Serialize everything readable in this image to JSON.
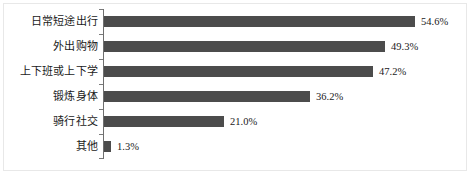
{
  "chart_data": {
    "type": "bar",
    "orientation": "horizontal",
    "title": "",
    "subtitle": "",
    "xlabel": "",
    "ylabel": "",
    "xlim": [
      0,
      60
    ],
    "grid": false,
    "legend": null,
    "value_suffix": "%",
    "categories": [
      "日常短途出行",
      "外出购物",
      "上下班或上下学",
      "锻炼身体",
      "骑行社交",
      "其他"
    ],
    "values": [
      54.6,
      49.3,
      47.2,
      36.2,
      21.0,
      1.3
    ],
    "data_labels": [
      "54.6%",
      "49.3%",
      "47.2%",
      "36.2%",
      "21.0%",
      "1.3%"
    ],
    "series": [
      {
        "name": "占比",
        "values": [
          54.6,
          49.3,
          47.2,
          36.2,
          21.0,
          1.3
        ]
      }
    ],
    "colors": {
      "bar": "#4c4c4c",
      "axis": "#6f6f6f",
      "text": "#1a1a1a",
      "background": "#ffffff"
    }
  }
}
